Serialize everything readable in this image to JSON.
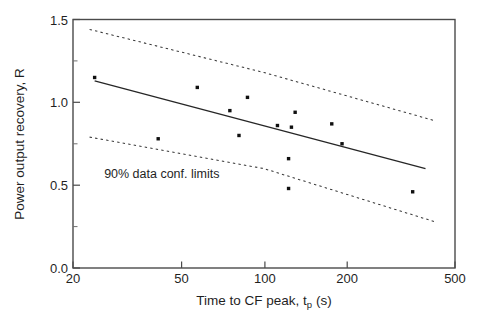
{
  "figure": {
    "background_color": "#ffffff",
    "foreground_color": "#1f1f1f"
  },
  "chart_data": {
    "type": "scatter",
    "title": "",
    "subtitle": "",
    "xlabel": "Time to CF peak, t",
    "xlabel_sub": "p",
    "xlabel_units": " (s)",
    "xlabel_full": "Time to CF peak, tp (s)",
    "ylabel": "Power output recovery, R",
    "xscale": "log",
    "yscale": "linear",
    "xlim": [
      20,
      500
    ],
    "ylim": [
      0.0,
      1.5
    ],
    "xticks": [
      20,
      50,
      100,
      200,
      500
    ],
    "xtick_labels": [
      "20",
      "50",
      "100",
      "200",
      "500"
    ],
    "yticks": [
      0.0,
      0.5,
      1.0,
      1.5
    ],
    "ytick_labels": [
      "0.0",
      "0.5",
      "1.0",
      "1.5"
    ],
    "yticks_minor": [
      0.25,
      0.75,
      1.25
    ],
    "grid": false,
    "legend": false,
    "series": [
      {
        "name": "data",
        "kind": "scatter",
        "marker": "square",
        "marker_color": "#101010",
        "points": [
          {
            "x": 24,
            "y": 1.15
          },
          {
            "x": 41,
            "y": 0.78
          },
          {
            "x": 57,
            "y": 1.09
          },
          {
            "x": 75,
            "y": 0.95
          },
          {
            "x": 81,
            "y": 0.8
          },
          {
            "x": 87,
            "y": 1.03
          },
          {
            "x": 112,
            "y": 0.86
          },
          {
            "x": 123,
            "y": 0.66
          },
          {
            "x": 123,
            "y": 0.48
          },
          {
            "x": 126,
            "y": 0.85
          },
          {
            "x": 130,
            "y": 0.94
          },
          {
            "x": 177,
            "y": 0.87
          },
          {
            "x": 193,
            "y": 0.75
          },
          {
            "x": 350,
            "y": 0.46
          }
        ]
      },
      {
        "name": "regression fit",
        "kind": "line",
        "style": "solid",
        "color": "#262626",
        "points": [
          {
            "x": 24,
            "y": 1.13
          },
          {
            "x": 390,
            "y": 0.6
          }
        ]
      },
      {
        "name": "upper 90% confidence limit",
        "kind": "line",
        "style": "dashed",
        "color": "#3a3a3a",
        "points": [
          {
            "x": 23,
            "y": 1.44
          },
          {
            "x": 100,
            "y": 1.18
          },
          {
            "x": 420,
            "y": 0.89
          }
        ]
      },
      {
        "name": "lower 90% confidence limit",
        "kind": "line",
        "style": "dashed",
        "color": "#3a3a3a",
        "points": [
          {
            "x": 23,
            "y": 0.79
          },
          {
            "x": 100,
            "y": 0.6
          },
          {
            "x": 420,
            "y": 0.28
          }
        ]
      }
    ],
    "annotations": [
      {
        "text": "90% data conf. limits",
        "x": 26,
        "y": 0.545
      }
    ]
  }
}
